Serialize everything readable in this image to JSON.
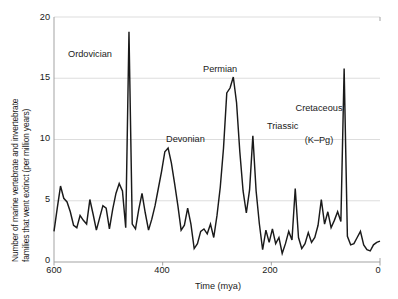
{
  "chart_data": {
    "type": "line",
    "title": "",
    "xlabel": "Time (mya)",
    "ylabel": "Number of marine vertebrate and invertebrate families that went extinct (per million years)",
    "ylabel_line1": "Number of marine vertebrate and invertebrate",
    "ylabel_line2": "families that went extinct (per million years)",
    "xlim": [
      600,
      0
    ],
    "ylim": [
      0,
      20
    ],
    "x_reversed": true,
    "grid": "horizontal",
    "legend": "none",
    "xticks": [
      "600",
      "400",
      "200",
      "0"
    ],
    "xtick_values": [
      600,
      400,
      200,
      0
    ],
    "yticks": [
      "0",
      "5",
      "10",
      "15",
      "20"
    ],
    "ytick_values": [
      0,
      5,
      10,
      15,
      20
    ],
    "line_color": "#1a1a1a",
    "grid_color": "#d9d9d9",
    "axis_color": "#999999",
    "background": "#ffffff",
    "series": [
      {
        "name": "Extinction intensity",
        "x": [
          600,
          594,
          588,
          582,
          576,
          570,
          564,
          558,
          552,
          546,
          540,
          534,
          528,
          522,
          516,
          510,
          504,
          498,
          492,
          486,
          480,
          474,
          468,
          462,
          456,
          450,
          444,
          438,
          432,
          426,
          420,
          414,
          408,
          402,
          396,
          390,
          384,
          378,
          372,
          366,
          360,
          354,
          348,
          342,
          336,
          330,
          324,
          318,
          312,
          306,
          300,
          294,
          288,
          282,
          276,
          270,
          264,
          258,
          252,
          246,
          240,
          234,
          228,
          222,
          216,
          210,
          204,
          198,
          192,
          186,
          180,
          174,
          168,
          162,
          156,
          150,
          144,
          138,
          132,
          126,
          120,
          114,
          108,
          102,
          96,
          90,
          84,
          78,
          72,
          66,
          60,
          54,
          48,
          42,
          36,
          30,
          24,
          18,
          12,
          6,
          0
        ],
        "y": [
          2.5,
          4.4,
          6.2,
          5.2,
          4.9,
          4.1,
          3.0,
          2.8,
          3.8,
          3.4,
          3.1,
          5.1,
          3.9,
          2.6,
          3.6,
          4.6,
          4.4,
          2.7,
          4.3,
          5.6,
          6.4,
          5.8,
          2.8,
          18.8,
          3.1,
          2.7,
          4.3,
          5.6,
          4.0,
          2.6,
          3.5,
          4.6,
          6.0,
          7.4,
          9.0,
          9.3,
          8.1,
          6.4,
          4.6,
          2.6,
          3.0,
          4.4,
          3.1,
          1.1,
          1.5,
          2.5,
          2.7,
          2.3,
          3.1,
          2.0,
          3.8,
          6.1,
          9.3,
          13.8,
          14.2,
          15.1,
          13.0,
          9.0,
          5.8,
          4.0,
          5.9,
          10.3,
          5.8,
          3.1,
          1.0,
          2.6,
          1.6,
          2.7,
          1.5,
          2.0,
          0.7,
          1.5,
          2.5,
          1.8,
          6.0,
          2.0,
          1.1,
          1.5,
          2.4,
          1.6,
          2.0,
          3.0,
          5.1,
          3.1,
          4.1,
          2.8,
          3.4,
          4.1,
          3.3,
          15.8,
          2.1,
          1.4,
          1.5,
          2.0,
          2.5,
          1.4,
          1.0,
          0.9,
          1.4,
          1.6,
          1.7
        ]
      }
    ],
    "annotations": [
      {
        "id": "ordovician",
        "label": "Ordovician",
        "x": 480,
        "y": 16.3,
        "peak_x": 462,
        "peak_y": 18.8
      },
      {
        "id": "devonian",
        "label": "Devonian",
        "x": 372,
        "y": 9.9,
        "peak_x": 390,
        "peak_y": 9.3
      },
      {
        "id": "permian",
        "label": "Permian",
        "x": 290,
        "y": 15.6,
        "peak_x": 270,
        "peak_y": 15.1
      },
      {
        "id": "triassic",
        "label": "Triassic",
        "x": 200,
        "y": 10.5,
        "peak_x": 234,
        "peak_y": 10.3
      },
      {
        "id": "cretaceous",
        "label": "Cretaceous\n(K–Pg)",
        "line1": "Cretaceous",
        "line2": "(K–Pg)",
        "x": 120,
        "y": 13.6,
        "peak_x": 66,
        "peak_y": 15.8
      }
    ]
  }
}
